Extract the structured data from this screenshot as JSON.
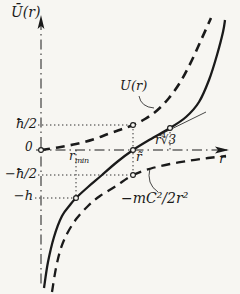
{
  "figure": {
    "background": "#f7f6f2",
    "ink": "#1a1a1a",
    "labels": {
      "y_axis": "Ū(r)",
      "upper_curve": "U(r)",
      "tick_hbar_half": "ħ/2",
      "origin": "0",
      "tick_neg_hbar_half": "−ħ/2",
      "tick_neg_h": "−h",
      "r_min_base": "r",
      "r_min_sub": "min",
      "r_tilde": "r̃",
      "r_tilde_root": "r̃∜3",
      "x_axis": "r",
      "lower_curve": "−mC²/2r²"
    }
  },
  "chart_data": {
    "type": "line",
    "xlabel": "r",
    "ylabel": "Ū(r)",
    "axis_style": "dash-dot",
    "grid": false,
    "y_ticks": [
      {
        "label": "ħ/2",
        "value_hbar_half_units": 1,
        "y_px": 125
      },
      {
        "label": "0",
        "value_hbar_half_units": 0,
        "y_px": 150
      },
      {
        "label": "−ħ/2",
        "value_hbar_half_units": -1,
        "y_px": 175
      },
      {
        "label": "−h",
        "value_hbar_half_units": -1.92,
        "y_px": 198
      }
    ],
    "x_marks": [
      {
        "label": "rmin",
        "value_r_tilde_units": 0.38,
        "x_px": 76
      },
      {
        "label": "r̃",
        "value_r_tilde_units": 1.0,
        "x_px": 133
      },
      {
        "label": "r̃∜3",
        "value_r_tilde_units": 1.4,
        "x_px": 170
      }
    ],
    "origin_px": [
      41,
      150
    ],
    "unit_scale": {
      "x_px_per_r_tilde": 92,
      "y_px_per_hbar_half": 25
    },
    "key_points": [
      {
        "desc": "U(r̃) = ħ/2",
        "px": [
          133,
          125
        ]
      },
      {
        "desc": "Ū(r̃) = 0",
        "px": [
          133,
          150
        ]
      },
      {
        "desc": "−mC²/2r̃² = −ħ/2",
        "px": [
          133,
          175
        ]
      },
      {
        "desc": "Ū(rmin) = −h",
        "px": [
          76,
          198
        ]
      },
      {
        "desc": "inflection / tangent point at r̃∜3",
        "px": [
          170,
          128
        ]
      }
    ],
    "series": [
      {
        "name": "U(r)",
        "style": "dashed",
        "width": 2.6,
        "dash": "9 6",
        "points_px": [
          [
            41,
            150
          ],
          [
            58,
            147.5
          ],
          [
            76,
            144
          ],
          [
            93,
            139.5
          ],
          [
            108,
            134
          ],
          [
            121,
            129.5
          ],
          [
            133,
            125
          ],
          [
            145,
            119
          ],
          [
            157,
            110.5
          ],
          [
            169,
            98
          ],
          [
            181,
            81
          ],
          [
            192,
            60
          ],
          [
            202,
            38
          ],
          [
            211,
            18
          ]
        ]
      },
      {
        "name": "Ū(r)",
        "style": "solid",
        "width": 2.3,
        "points_px": [
          [
            44,
            288
          ],
          [
            48,
            262
          ],
          [
            54,
            237
          ],
          [
            62,
            216
          ],
          [
            70,
            205
          ],
          [
            76,
            198
          ],
          [
            88,
            187
          ],
          [
            102,
            175
          ],
          [
            117,
            162
          ],
          [
            133,
            150
          ],
          [
            150,
            139.5
          ],
          [
            170,
            128
          ],
          [
            186,
            117
          ],
          [
            199,
            102
          ],
          [
            209,
            80
          ],
          [
            217,
            55
          ],
          [
            223,
            32
          ],
          [
            225,
            20
          ]
        ]
      },
      {
        "name": "−mC²/2r²",
        "style": "dashed",
        "width": 2.3,
        "dash": "9 6",
        "points_px": [
          [
            52,
            292
          ],
          [
            56,
            268
          ],
          [
            61,
            248
          ],
          [
            68,
            232
          ],
          [
            77,
            218
          ],
          [
            88,
            206
          ],
          [
            100,
            196
          ],
          [
            116,
            186
          ],
          [
            133,
            175
          ],
          [
            151,
            168.5
          ],
          [
            170,
            164
          ],
          [
            190,
            160.5
          ],
          [
            208,
            158
          ],
          [
            226,
            156
          ]
        ]
      }
    ],
    "markers_px": [
      [
        41,
        150
      ],
      [
        76,
        198
      ],
      [
        133,
        125
      ],
      [
        133,
        150
      ],
      [
        133,
        175
      ],
      [
        170,
        128
      ]
    ],
    "guides_px": [
      {
        "from": [
          38,
          125
        ],
        "to": [
          133,
          125
        ]
      },
      {
        "from": [
          38,
          175
        ],
        "to": [
          133,
          175
        ]
      },
      {
        "from": [
          35,
          198
        ],
        "to": [
          76,
          198
        ]
      },
      {
        "from": [
          76,
          150
        ],
        "to": [
          76,
          198
        ]
      },
      {
        "from": [
          133,
          125
        ],
        "to": [
          133,
          175
        ]
      },
      {
        "from": [
          170,
          128
        ],
        "to": [
          170,
          150
        ]
      }
    ],
    "tangent_px": {
      "from": [
        147,
        141
      ],
      "to": [
        206,
        112
      ]
    },
    "leaders": [
      {
        "name": "leader-to-U-curve",
        "from": [
          139,
          96
        ],
        "ctrl": [
          141,
          107
        ],
        "to": [
          154,
          108
        ]
      },
      {
        "name": "leader-to-lower-curve",
        "from": [
          158,
          192
        ],
        "ctrl": [
          146,
          184
        ],
        "to": [
          150,
          168
        ]
      }
    ],
    "axes_px": {
      "y": {
        "x": 41,
        "top": 20,
        "bottom": 287
      },
      "x": {
        "y": 150,
        "left": 36,
        "right": 227
      }
    }
  }
}
